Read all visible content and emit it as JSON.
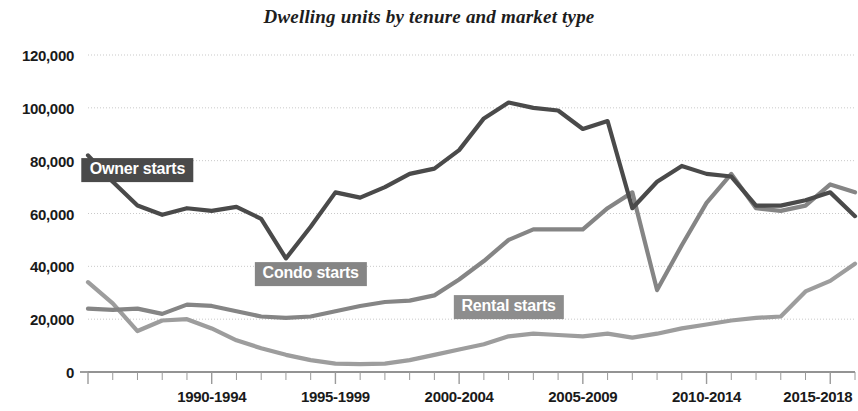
{
  "chart_data": {
    "type": "line",
    "title": "Dwelling units by tenure and market type",
    "xlabel": "",
    "ylabel": "",
    "ylim": [
      0,
      120000
    ],
    "grid": true,
    "legend_position": "inline-labels",
    "y_ticks": [
      "0",
      "20,000",
      "40,000",
      "60,000",
      "80,000",
      "100,000",
      "120,000"
    ],
    "y_tick_values": [
      0,
      20000,
      40000,
      60000,
      80000,
      100000,
      120000
    ],
    "x_tick_labels": [
      "1990-1994",
      "1995-1999",
      "2000-2004",
      "2005-2009",
      "2010-2014",
      "2015-2018"
    ],
    "x": [
      1987,
      1988,
      1989,
      1990,
      1991,
      1992,
      1993,
      1994,
      1995,
      1996,
      1997,
      1998,
      1999,
      2000,
      2001,
      2002,
      2003,
      2004,
      2005,
      2006,
      2007,
      2008,
      2009,
      2010,
      2011,
      2012,
      2013,
      2014,
      2015,
      2016,
      2017,
      2018
    ],
    "series": [
      {
        "name": "Owner starts",
        "color": "#4a4a4a",
        "label_bg": "#4a4a4a",
        "values": [
          82000,
          72000,
          63000,
          59500,
          62000,
          61000,
          62500,
          58000,
          43000,
          55000,
          68000,
          66000,
          70000,
          75000,
          77000,
          84000,
          96000,
          102000,
          100000,
          99000,
          92000,
          95000,
          62000,
          72000,
          78000,
          75000,
          74000,
          63000,
          63000,
          65000,
          68000,
          59000
        ],
        "label_point": {
          "x": 1989,
          "value": 76500
        }
      },
      {
        "name": "Condo starts",
        "color": "#858585",
        "label_bg": "#858585",
        "values": [
          24000,
          23500,
          24000,
          22000,
          25500,
          25000,
          23000,
          21000,
          20500,
          21000,
          23000,
          25000,
          26500,
          27000,
          29000,
          35000,
          42000,
          50000,
          54000,
          54000,
          54000,
          62000,
          68000,
          31000,
          48000,
          64000,
          75000,
          62000,
          61000,
          63000,
          71000,
          68000
        ],
        "label_point": {
          "x": 1996,
          "value": 37000
        }
      },
      {
        "name": "Rental starts",
        "color": "#9d9d9d",
        "label_bg": "#8d8d8d",
        "values": [
          34000,
          26000,
          15500,
          19500,
          20000,
          16500,
          12000,
          9000,
          6500,
          4500,
          3200,
          3000,
          3200,
          4500,
          6500,
          8500,
          10500,
          13500,
          14500,
          14000,
          13500,
          14500,
          13000,
          14500,
          16500,
          18000,
          19500,
          20500,
          21000,
          30500,
          34500,
          41000
        ],
        "label_point": {
          "x": 2004,
          "value": 24500
        }
      }
    ]
  },
  "axis": {
    "y_labels": [
      {
        "text": "120,000",
        "value": 120000
      },
      {
        "text": "100,000",
        "value": 100000
      },
      {
        "text": "80,000",
        "value": 80000
      },
      {
        "text": "60,000",
        "value": 60000
      },
      {
        "text": "40,000",
        "value": 40000
      },
      {
        "text": "20,000",
        "value": 20000
      },
      {
        "text": "0",
        "value": 0
      }
    ],
    "x_labels": [
      {
        "text": "1990-1994",
        "center": 1992
      },
      {
        "text": "1995-1999",
        "center": 1997
      },
      {
        "text": "2000-2004",
        "center": 2002
      },
      {
        "text": "2005-2009",
        "center": 2007
      },
      {
        "text": "2010-2014",
        "center": 2012
      },
      {
        "text": "2015-2018",
        "center": 2016.5
      }
    ]
  },
  "style": {
    "background": "#ffffff",
    "grid_color": "#c9c9c9",
    "axis_color": "#8a8a8a",
    "text_color": "#1a1a1a"
  }
}
